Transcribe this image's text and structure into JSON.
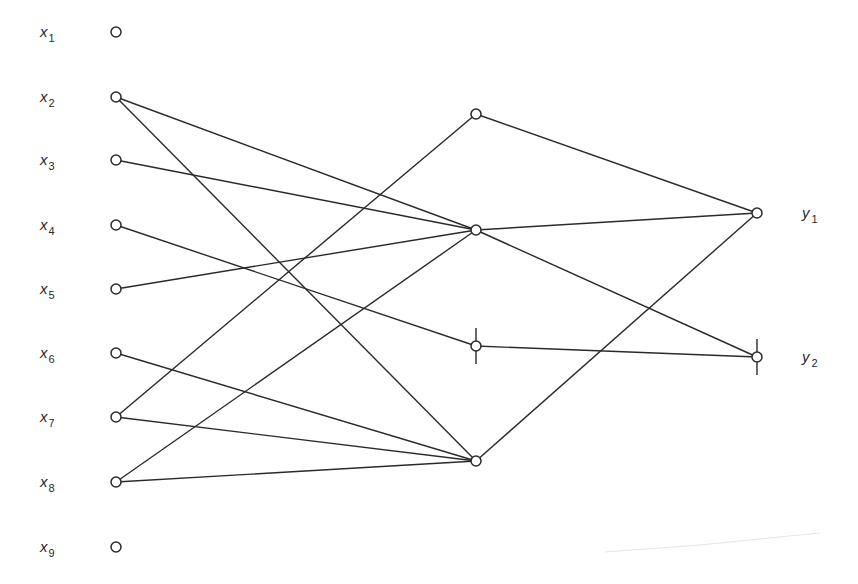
{
  "diagram": {
    "type": "network",
    "colors": {
      "line": "#2a2a2a",
      "node_fill": "#ffffff",
      "background": "#ffffff"
    },
    "layers": {
      "input": [
        {
          "id": "x1",
          "label": "x",
          "sub": "1",
          "cx": 116,
          "cy": 32
        },
        {
          "id": "x2",
          "label": "x",
          "sub": "2",
          "cx": 116,
          "cy": 97
        },
        {
          "id": "x3",
          "label": "x",
          "sub": "3",
          "cx": 116,
          "cy": 160
        },
        {
          "id": "x4",
          "label": "x",
          "sub": "4",
          "cx": 116,
          "cy": 225
        },
        {
          "id": "x5",
          "label": "x",
          "sub": "5",
          "cx": 116,
          "cy": 289
        },
        {
          "id": "x6",
          "label": "x",
          "sub": "6",
          "cx": 116,
          "cy": 353
        },
        {
          "id": "x7",
          "label": "x",
          "sub": "7",
          "cx": 116,
          "cy": 417
        },
        {
          "id": "x8",
          "label": "x",
          "sub": "8",
          "cx": 116,
          "cy": 482
        },
        {
          "id": "x9",
          "label": "x",
          "sub": "9",
          "cx": 116,
          "cy": 547
        }
      ],
      "hidden": [
        {
          "id": "h1",
          "cx": 476,
          "cy": 114,
          "marked": false
        },
        {
          "id": "h2",
          "cx": 476,
          "cy": 230,
          "marked": false
        },
        {
          "id": "h3",
          "cx": 476,
          "cy": 346,
          "marked": true
        },
        {
          "id": "h4",
          "cx": 476,
          "cy": 461,
          "marked": false
        }
      ],
      "output": [
        {
          "id": "y1",
          "label": "y",
          "sub": "1",
          "cx": 757,
          "cy": 213,
          "marked": false
        },
        {
          "id": "y2",
          "label": "y",
          "sub": "2",
          "cx": 757,
          "cy": 357,
          "marked": true
        }
      ]
    },
    "edges": [
      [
        "x2",
        "h2"
      ],
      [
        "x2",
        "h4"
      ],
      [
        "x3",
        "h2"
      ],
      [
        "x4",
        "h3"
      ],
      [
        "x5",
        "h2"
      ],
      [
        "x6",
        "h4"
      ],
      [
        "x7",
        "h1"
      ],
      [
        "x7",
        "h4"
      ],
      [
        "x8",
        "h2"
      ],
      [
        "x8",
        "h4"
      ],
      [
        "h1",
        "y1"
      ],
      [
        "h2",
        "y1"
      ],
      [
        "h2",
        "y2"
      ],
      [
        "h3",
        "y2"
      ],
      [
        "h4",
        "y1"
      ]
    ],
    "labels": {
      "x1": "x",
      "x1_sub": "1",
      "x2": "x",
      "x2_sub": "2",
      "x3": "x",
      "x3_sub": "3",
      "x4": "x",
      "x4_sub": "4",
      "x5": "x",
      "x5_sub": "5",
      "x6": "x",
      "x6_sub": "6",
      "x7": "x",
      "x7_sub": "7",
      "x8": "x",
      "x8_sub": "8",
      "x9": "x",
      "x9_sub": "9",
      "y1": "y",
      "y1_sub": "1",
      "y2": "y",
      "y2_sub": "2"
    }
  }
}
